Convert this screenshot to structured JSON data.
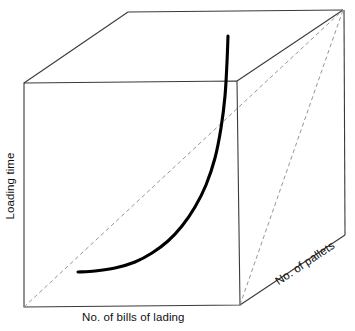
{
  "figure": {
    "type": "3d-axes-schematic",
    "background_color": "#ffffff",
    "line_color": "#3a3a3a",
    "dashed_color": "#7a7a7a",
    "curve_color": "#000000",
    "labels": {
      "y_axis": "Loading time",
      "x_axis": "No. of bills of lading",
      "z_axis": "No. of pallets"
    }
  },
  "chart_data": {
    "type": "line",
    "title": "",
    "xlabel": "No. of bills of lading",
    "ylabel": "Loading time",
    "zlabel": "No. of pallets",
    "grid": false,
    "legend": "none",
    "annotations": [
      "Exponentially rising relationship between number of bills of lading and loading time",
      "Dashed diagonal reference line from front-bottom-left corner to back-top-right corner of the cube",
      "Dashed diagonal reference line on right face from front-bottom-right corner to back-top-right corner"
    ],
    "series": [
      {
        "name": "Loading time curve",
        "style": "solid-thick",
        "color": "#000000",
        "points": [
          [
            78,
            272
          ],
          [
            95,
            271
          ],
          [
            115,
            268
          ],
          [
            135,
            262
          ],
          [
            152,
            253
          ],
          [
            168,
            241
          ],
          [
            182,
            226
          ],
          [
            195,
            207
          ],
          [
            206,
            185
          ],
          [
            215,
            158
          ],
          [
            221,
            128
          ],
          [
            225,
            96
          ],
          [
            227,
            62
          ],
          [
            228,
            36
          ]
        ]
      }
    ],
    "geometry": {
      "front_face": [
        [
          24,
          83
        ],
        [
          237,
          81
        ],
        [
          240,
          305
        ],
        [
          24,
          307
        ]
      ],
      "back_face": [
        [
          128,
          12
        ],
        [
          343,
          10
        ],
        [
          345,
          235
        ],
        [
          240,
          305
        ]
      ],
      "top_back_edge": [
        [
          128,
          12
        ],
        [
          343,
          10
        ]
      ],
      "left_top_edge": [
        [
          24,
          83
        ],
        [
          128,
          12
        ]
      ],
      "right_top_edge": [
        [
          237,
          81
        ],
        [
          343,
          10
        ]
      ],
      "right_bottom_edge": [
        [
          240,
          305
        ],
        [
          345,
          235
        ]
      ],
      "back_right_vertical": [
        [
          344,
          10
        ],
        [
          345,
          235
        ]
      ],
      "dashed_floor_diagonal": [
        [
          24,
          307
        ],
        [
          343,
          10
        ]
      ],
      "dashed_right_diagonal": [
        [
          240,
          305
        ],
        [
          343,
          10
        ]
      ]
    }
  }
}
